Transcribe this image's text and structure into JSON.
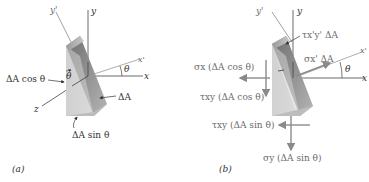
{
  "panel_a": {
    "caption": "(a)",
    "axes": {
      "y": "y",
      "y_prime": "y'",
      "x": "x",
      "x_prime": "x'",
      "z": "z"
    },
    "angle": "θ",
    "theta_on_face": "θ",
    "labels": {
      "area_cos": "ΔA cos θ",
      "area": "ΔA",
      "area_sin": "ΔA sin θ"
    }
  },
  "panel_b": {
    "caption": "(b)",
    "axes": {
      "y": "y",
      "y_prime": "y'",
      "x": "x",
      "x_prime": "x'"
    },
    "angle": "θ",
    "labels": {
      "tau_xpyp": "τx'y' ΔA",
      "sigma_xp": "σx' ΔA",
      "sigma_x": "σx (ΔA cos θ)",
      "tau_xy_cos": "τxy (ΔA cos θ)",
      "tau_xy_sin": "τxy (ΔA sin θ)",
      "sigma_y": "σy (ΔA sin θ)"
    }
  },
  "colors": {
    "axis": "#555555",
    "force_arrow": "#8a8a8a",
    "wedge_light": "#d6d6d6",
    "wedge_mid": "#bcbcbc",
    "wedge_dark": "#8e8e8e"
  }
}
